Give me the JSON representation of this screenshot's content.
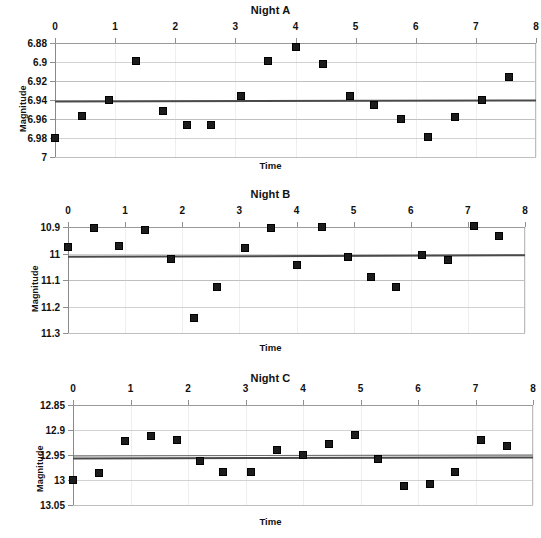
{
  "figure": {
    "background_color": "#ffffff",
    "marker_color": "#1c1c1c",
    "trendline_color": "#4a4a4a",
    "gridline_color": "#bfbfbf",
    "panel_count": 3
  },
  "chart_data": [
    {
      "type": "scatter",
      "title": "Night A",
      "xlabel": "Time",
      "ylabel": "Magnitude",
      "xlim": [
        0,
        8
      ],
      "ylim": [
        6.88,
        7
      ],
      "y_inverted": true,
      "x_axis_position": "top",
      "grid": true,
      "xticks": [
        0,
        1,
        2,
        3,
        4,
        5,
        6,
        7,
        8
      ],
      "xtick_labels": [
        "0",
        "1",
        "2",
        "3",
        "4",
        "5",
        "6",
        "7",
        "8"
      ],
      "yticks": [
        6.88,
        6.9,
        6.92,
        6.94,
        6.96,
        6.98,
        7
      ],
      "ytick_labels": [
        "6.88",
        "6.9",
        "6.92",
        "6.94",
        "6.96",
        "6.98",
        "7"
      ],
      "trendline": {
        "y_left": 6.9405,
        "y_right": 6.9395,
        "label": "mean magnitude"
      },
      "x": [
        0.0,
        0.45,
        0.9,
        1.35,
        1.8,
        2.2,
        2.6,
        3.1,
        3.55,
        4.0,
        4.45,
        4.9,
        5.3,
        5.75,
        6.2,
        6.65,
        7.1,
        7.55
      ],
      "y": [
        6.98,
        6.957,
        6.94,
        6.899,
        6.952,
        6.966,
        6.966,
        6.936,
        6.899,
        6.884,
        6.902,
        6.936,
        6.945,
        6.96,
        6.979,
        6.958,
        6.94,
        6.916
      ]
    },
    {
      "type": "scatter",
      "title": "Night B",
      "xlabel": "Time",
      "ylabel": "Magnitude",
      "xlim": [
        0,
        8
      ],
      "ylim": [
        10.9,
        11.3
      ],
      "y_inverted": true,
      "x_axis_position": "top",
      "grid": true,
      "xticks": [
        0,
        1,
        2,
        3,
        4,
        5,
        6,
        7,
        8
      ],
      "xtick_labels": [
        "0",
        "1",
        "2",
        "3",
        "4",
        "5",
        "6",
        "7",
        "8"
      ],
      "yticks": [
        10.9,
        11.0,
        11.1,
        11.2,
        11.3
      ],
      "ytick_labels": [
        "10.9",
        "11",
        "11.1",
        "11.2",
        "11.3"
      ],
      "trendline": {
        "y_left": 11.008,
        "y_right": 11.002,
        "label": "mean magnitude"
      },
      "x": [
        0.0,
        0.45,
        0.9,
        1.35,
        1.8,
        2.2,
        2.6,
        3.1,
        3.55,
        4.0,
        4.45,
        4.9,
        5.3,
        5.75,
        6.2,
        6.65,
        7.1,
        7.55
      ],
      "y": [
        10.975,
        10.902,
        10.972,
        10.912,
        11.022,
        11.245,
        11.125,
        10.979,
        10.904,
        11.045,
        10.901,
        11.012,
        11.088,
        11.127,
        11.007,
        11.025,
        10.897,
        10.934
      ]
    },
    {
      "type": "scatter",
      "title": "Night C",
      "xlabel": "Time",
      "ylabel": "Magnitude",
      "xlim": [
        0,
        8
      ],
      "ylim": [
        12.85,
        13.05
      ],
      "y_inverted": true,
      "x_axis_position": "top",
      "grid": true,
      "xticks": [
        0,
        1,
        2,
        3,
        4,
        5,
        6,
        7,
        8
      ],
      "xtick_labels": [
        "0",
        "1",
        "2",
        "3",
        "4",
        "5",
        "6",
        "7",
        "8"
      ],
      "yticks": [
        12.85,
        12.9,
        12.95,
        13.0,
        13.05
      ],
      "ytick_labels": [
        "12.85",
        "12.9",
        "12.95",
        "13",
        "13.05"
      ],
      "trendline": {
        "y_left": 12.9555,
        "y_right": 12.9535,
        "label": "mean magnitude"
      },
      "trendline_secondary": {
        "y_left": 12.9515,
        "y_right": 12.9495
      },
      "x": [
        0.0,
        0.45,
        0.9,
        1.35,
        1.8,
        2.2,
        2.6,
        3.1,
        3.55,
        4.0,
        4.45,
        4.9,
        5.3,
        5.75,
        6.2,
        6.65,
        7.1,
        7.55
      ],
      "y": [
        13.0,
        12.985,
        12.922,
        12.912,
        12.92,
        12.962,
        12.983,
        12.983,
        12.94,
        12.95,
        12.928,
        12.91,
        12.957,
        13.012,
        13.008,
        12.983,
        12.92,
        12.932
      ]
    }
  ]
}
